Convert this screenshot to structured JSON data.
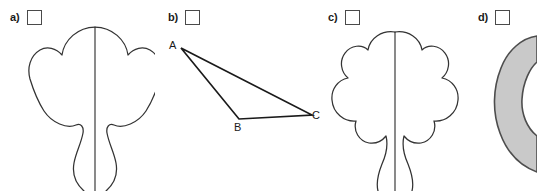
{
  "page": {
    "width": 537,
    "height": 191,
    "background_color": "#ffffff",
    "kind": "multiple-choice-figure-row"
  },
  "options": [
    {
      "letter": "a)",
      "checkbox_checked": false,
      "figure": {
        "name": "symmetric-tree-shape-rounded",
        "description": "Bilaterally symmetric rounded tree/clover outline with vertical axis of symmetry line",
        "stroke_color": "#333333",
        "fill_color": "none",
        "has_axis_line": true
      }
    },
    {
      "letter": "b)",
      "checkbox_checked": false,
      "figure": {
        "name": "triangle-abc",
        "description": "Scalene triangle with labeled vertices",
        "stroke_color": "#1a1a1a",
        "fill_color": "none",
        "has_axis_line": false,
        "vertices": [
          {
            "label": "A",
            "x": 28,
            "y": 24
          },
          {
            "label": "B",
            "x": 86,
            "y": 94
          },
          {
            "label": "C",
            "x": 160,
            "y": 90
          }
        ]
      }
    },
    {
      "letter": "c)",
      "checkbox_checked": false,
      "figure": {
        "name": "symmetric-tree-shape-scalloped",
        "description": "Bilaterally symmetric scalloped cloud-like tree outline with vertical axis of symmetry line",
        "stroke_color": "#333333",
        "fill_color": "none",
        "has_axis_line": true
      }
    },
    {
      "letter": "d)",
      "checkbox_checked": false,
      "figure": {
        "name": "gray-crescent-shape",
        "description": "Gray filled crescent / leaf shape cropped by the right edge of the image",
        "stroke_color": "#4d4d4d",
        "fill_color": "#c9c9c9",
        "has_axis_line": false
      }
    }
  ]
}
